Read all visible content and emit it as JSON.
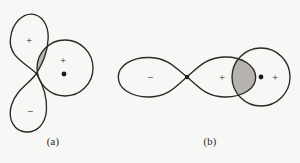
{
  "figure": {
    "background_color": "#f7f7f5",
    "stroke_color": "#2b2825",
    "shade_color": "#b6b3ae",
    "sign_color": "#2b2825",
    "nucleus_color": "#1c1a18"
  },
  "panels": [
    {
      "id": "a",
      "caption": "(a)",
      "description": "Perpendicular p orbital and s orbital: zero net overlap",
      "orbitals": [
        {
          "name": "p-orbital-vertical",
          "lobes": [
            {
              "name": "p-lobe-top",
              "sign": "+",
              "sign_x": 29,
              "sign_y": 40
            },
            {
              "name": "p-lobe-bottom",
              "sign": "−",
              "sign_x": 30,
              "sign_y": 111
            }
          ]
        },
        {
          "name": "s-orbital-circle",
          "sign": "+",
          "sign_x": 63,
          "sign_y": 60,
          "nucleus_x": 64,
          "nucleus_y": 74
        }
      ],
      "overlap_regions": [
        {
          "name": "overlap-upper-crescent"
        },
        {
          "name": "overlap-lower-crescent"
        }
      ]
    },
    {
      "id": "b",
      "caption": "(b)",
      "description": "Collinear p orbital and s orbital: sigma bonding overlap",
      "orbitals": [
        {
          "name": "p-orbital-horizontal",
          "lobes": [
            {
              "name": "p-lobe-left",
              "sign": "−",
              "sign_x": 150,
              "sign_y": 77
            },
            {
              "name": "p-lobe-right",
              "sign": "+",
              "sign_x": 222,
              "sign_y": 77
            }
          ]
        },
        {
          "name": "s-orbital-circle",
          "sign": "+",
          "sign_x": 275,
          "sign_y": 77,
          "nucleus_x": 261,
          "nucleus_y": 77
        }
      ],
      "overlap_regions": [
        {
          "name": "overlap-lens"
        }
      ],
      "node_point": {
        "name": "p-orbital-node",
        "x": 187,
        "y": 77
      }
    }
  ]
}
